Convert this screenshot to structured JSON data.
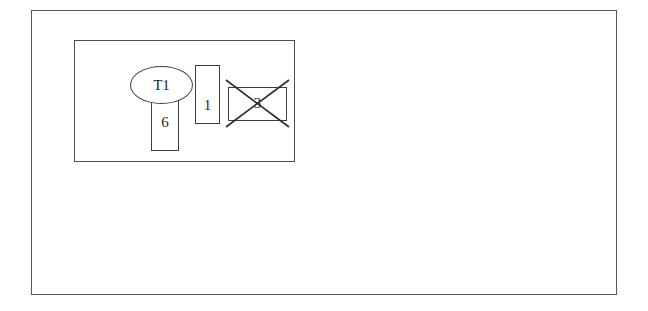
{
  "diagram": {
    "title": "",
    "background_color": "#ffffff",
    "stroke_color": "#3f3f41",
    "frames": {
      "outer": {
        "name": "outer-frame"
      },
      "inner": {
        "name": "inner-frame"
      }
    },
    "nodes": [
      {
        "id": "t1",
        "shape": "ellipse",
        "label": "T1",
        "state": "normal"
      },
      {
        "id": "n6",
        "shape": "rectangle",
        "label": "6",
        "state": "normal"
      },
      {
        "id": "n1",
        "shape": "rectangle",
        "label": "1",
        "state": "normal"
      },
      {
        "id": "n3",
        "shape": "rectangle",
        "label": "3",
        "state": "crossed-out"
      }
    ]
  }
}
